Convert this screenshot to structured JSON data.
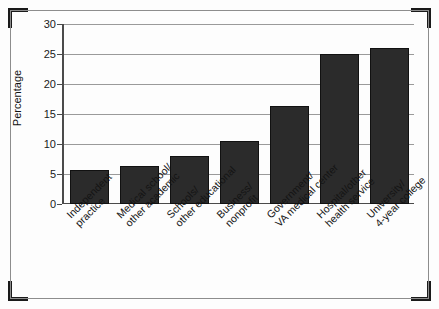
{
  "chart_data": {
    "type": "bar",
    "title": "",
    "xlabel": "",
    "ylabel": "Percentage",
    "ylim": [
      0,
      30
    ],
    "yticks": [
      0,
      5,
      10,
      15,
      20,
      25,
      30
    ],
    "grid": true,
    "legend": "none",
    "bar_color": "#2b2b2b",
    "categories": [
      "Independent practice",
      "Medical school/other academic",
      "Schools/other educational",
      "Business/nonprofit",
      "Government/VA medical center",
      "Hospital/other health service",
      "University/4-year college"
    ],
    "category_lines": [
      [
        "Independent",
        "practice"
      ],
      [
        "Medical school/",
        "other academic"
      ],
      [
        "Schools/",
        "other educational"
      ],
      [
        "Business/",
        "nonprofit"
      ],
      [
        "Government/",
        "VA medical center"
      ],
      [
        "Hospital/other",
        "health service"
      ],
      [
        "University/",
        "4-year college"
      ]
    ],
    "values": [
      5.7,
      6.3,
      8.0,
      10.5,
      16.3,
      25.0,
      26.0
    ]
  }
}
